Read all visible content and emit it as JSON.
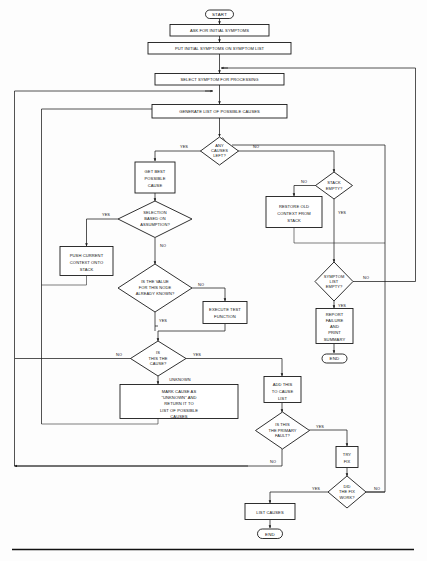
{
  "document": {
    "title": "Diagnostic Expert System Flowchart",
    "caption": ""
  },
  "nodes": {
    "start": {
      "label": "START",
      "type": "terminator"
    },
    "ask_symptoms": {
      "label": "ASK FOR INITIAL SYMPTOMS",
      "type": "process"
    },
    "put_symptoms": {
      "label": "PUT INITIAL SYMPTOMS ON SYMPTOM LIST",
      "type": "process"
    },
    "select_symptom": {
      "label": "SELECT SYMPTOM FOR PROCESSING",
      "type": "process"
    },
    "generate_causes": {
      "label": "GENERATE LIST OF POSSIBLE CAUSES",
      "type": "process"
    },
    "any_causes": {
      "lines": [
        "ANY",
        "CAUSES",
        "LEFT?"
      ],
      "type": "decision"
    },
    "get_best_cause": {
      "lines": [
        "GET BEST",
        "POSSIBLE",
        "CAUSE"
      ],
      "type": "process"
    },
    "selection_assumption": {
      "lines": [
        "SELECTION",
        "BASED ON",
        "ASSUMPTION?"
      ],
      "type": "decision"
    },
    "push_context": {
      "lines": [
        "PUSH CURRENT",
        "CONTEXT ONTO",
        "STACK"
      ],
      "type": "process"
    },
    "value_known": {
      "lines": [
        "IS THE VALUE",
        "FOR THIS NODE",
        "ALREADY KNOWN?"
      ],
      "type": "decision"
    },
    "execute_test": {
      "lines": [
        "EXECUTE TEST",
        "FUNCTION"
      ],
      "type": "process"
    },
    "stack_empty": {
      "lines": [
        "STACK",
        "EMPTY?"
      ],
      "type": "decision"
    },
    "restore_context": {
      "lines": [
        "RESTORE OLD",
        "CONTEXT FROM",
        "STACK"
      ],
      "type": "process"
    },
    "symptom_list_empty": {
      "lines": [
        "SYMPTOM",
        "LIST",
        "EMPTY?"
      ],
      "type": "decision"
    },
    "report_failure": {
      "lines": [
        "REPORT",
        "FAILURE",
        "AND",
        "PRINT",
        "SUMMARY"
      ],
      "type": "process"
    },
    "end_failure": {
      "label": "END",
      "type": "terminator"
    },
    "is_this_cause": {
      "lines": [
        "IS",
        "THIS THE",
        "CAUSE?"
      ],
      "type": "decision"
    },
    "mark_unknown": {
      "lines": [
        "MARK CAUSE AS",
        "\"UNKNOWN\" AND",
        "RETURN IT TO",
        "LIST OF POSSIBLE",
        "CAUSES"
      ],
      "type": "process"
    },
    "add_to_cause_list": {
      "lines": [
        "ADD THIS",
        "TO CAUSE",
        "LIST"
      ],
      "type": "process"
    },
    "is_primary_fault": {
      "lines": [
        "IS THIS",
        "THE PRIMARY",
        "FAULT?"
      ],
      "type": "decision"
    },
    "try_fix": {
      "lines": [
        "TRY",
        "FIX"
      ],
      "type": "process"
    },
    "did_fix_work": {
      "lines": [
        "DID",
        "THE FIX",
        "WORK?"
      ],
      "type": "decision"
    },
    "list_causes": {
      "label": "LIST CAUSES",
      "type": "process"
    },
    "end_success": {
      "label": "END",
      "type": "terminator"
    }
  },
  "edge_labels": {
    "any_causes_yes": "YES",
    "any_causes_no": "NO",
    "selection_yes": "YES",
    "selection_no": "NO",
    "value_known_no": "NO",
    "value_known_yes": "YES",
    "stack_empty_no": "NO",
    "stack_empty_yes": "YES",
    "symptom_empty_no": "NO",
    "symptom_empty_yes": "YES",
    "is_cause_no": "NO",
    "is_cause_yes": "YES",
    "is_cause_unknown": "UNKNOWN",
    "primary_yes": "YES",
    "primary_no": "NO",
    "fix_yes": "YES",
    "fix_no": "NO"
  },
  "style": {
    "stroke": "#1a1a1a",
    "fill": "#ffffff",
    "background": "#fdfdfd"
  }
}
